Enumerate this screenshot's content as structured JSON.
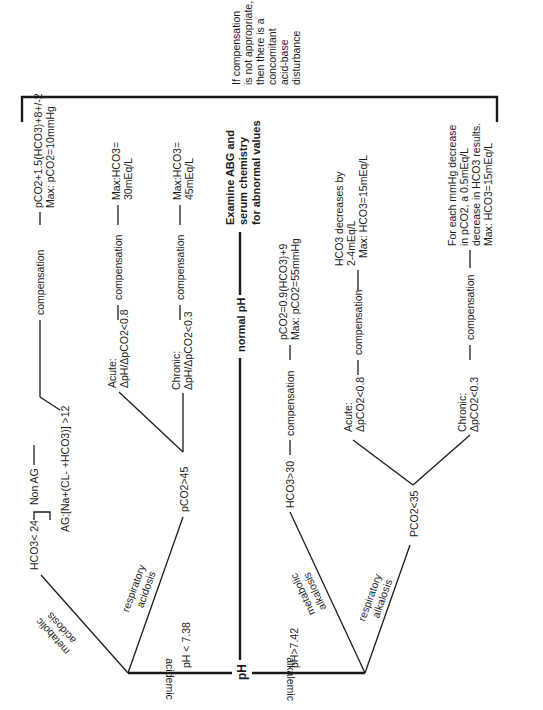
{
  "diagram": {
    "orientation": "rotated -90 degrees (text reads bottom-to-top)",
    "root": {
      "label": "pH"
    },
    "normal": {
      "label": "normal pH",
      "action_lines": [
        "Examine ABG and",
        "serum chemistry",
        "for abnormal values"
      ]
    },
    "bracket_note": [
      "If compensation",
      "is not appropriate,",
      "then there is a",
      "concomitant",
      "acid-base",
      "disturbance"
    ],
    "acidemic": {
      "edge_label": "acidemic",
      "threshold": "pH < 7.38",
      "metabolic": {
        "edge_label_lines": [
          "metabolic",
          "acidosis"
        ],
        "criterion": "HCO3< 24",
        "non_ag": "Non AG",
        "ag": "AG:[Na+(CL- +HCO3)] >12",
        "compensation_label": "compensation",
        "formula_lines": [
          "pCO2+1.5(HCO3)+8+/-2",
          "Max: pCO2=10mmHg"
        ]
      },
      "respiratory": {
        "edge_label_lines": [
          "respiratory",
          "acidosis"
        ],
        "criterion": "pCO2>45",
        "acute": {
          "label_lines": [
            "Acute:",
            "ΔpH/ΔpCO2<0.8"
          ],
          "compensation_label": "compensation",
          "result_lines": [
            "Max:HCO3=",
            "30mEq/L"
          ]
        },
        "chronic": {
          "label_lines": [
            "Chronic:",
            "ΔpH/ΔpCO2<0.3"
          ],
          "compensation_label": "compensation",
          "result_lines": [
            "Max:HCO3=",
            "45mEq/L"
          ]
        }
      }
    },
    "alkalemic": {
      "edge_label": "alkalemic",
      "threshold": "pH>7.42",
      "metabolic": {
        "edge_label_lines": [
          "metabolic",
          "alkalosis"
        ],
        "criterion": "HCO3>30",
        "compensation_label": "compensation",
        "formula_lines": [
          "pCO2=0.9(HCO3)+9",
          "Max: pCO2=55mmHg"
        ]
      },
      "respiratory": {
        "edge_label_lines": [
          "respiratory",
          "alkalosis"
        ],
        "criterion": "PCO2<35",
        "acute": {
          "label_lines": [
            "Acute:",
            "ΔpCO2<0.8"
          ],
          "compensation_label": "compensation",
          "result_lines": [
            "HCO3 decreases by",
            "2-4mEq/L",
            "Max: HCO3=15mEq/L"
          ]
        },
        "chronic": {
          "label_lines": [
            "Chronic:",
            "ΔpCO2<0.3"
          ],
          "compensation_label": "compensation",
          "result_lines": [
            "For each mmHg decrease",
            "in pCO2, a 0.5mEq/L",
            "decrease in HCO3 results.",
            "Max: HCO3=15mEq/L"
          ]
        }
      }
    }
  }
}
